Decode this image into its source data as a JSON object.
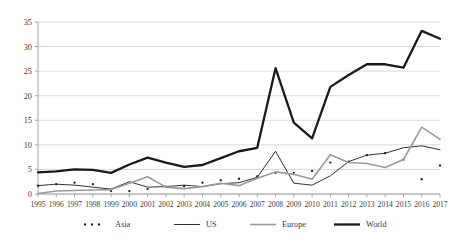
{
  "chart_data": {
    "type": "line",
    "title": "",
    "subtitle": "",
    "xlabel": "",
    "ylabel": "",
    "grid": "horizontal",
    "legend_position": "bottom",
    "ylim": [
      0,
      35
    ],
    "yticks": [
      0,
      5,
      10,
      15,
      20,
      25,
      30,
      35
    ],
    "ytick_labels": [
      "0",
      "5",
      "10",
      "15",
      "20",
      "25",
      "30",
      "35"
    ],
    "categories": [
      "1995",
      "1996",
      "1997",
      "1998",
      "1999",
      "2000",
      "2001",
      "2002",
      "2003",
      "2004",
      "2005",
      "2006",
      "2007",
      "2008",
      "2009",
      "2010",
      "2011",
      "2012",
      "2013",
      "2014",
      "2015",
      "2016",
      "2017"
    ],
    "series": [
      {
        "name": "Asia",
        "style": "dotted",
        "color": "#1a1a1a",
        "values": [
          1.7,
          2.0,
          2.3,
          2.0,
          0.6,
          0.6,
          1.0,
          1.5,
          1.6,
          2.3,
          2.8,
          3.1,
          3.6,
          4.3,
          4.3,
          4.7,
          6.4,
          6.6,
          7.9,
          8.3,
          7.0,
          3.0,
          5.8
        ]
      },
      {
        "name": "US",
        "style": "thin-solid",
        "color": "#1a1a1a",
        "values": [
          1.7,
          2.0,
          1.8,
          1.4,
          1.0,
          2.5,
          1.4,
          1.5,
          1.8,
          1.5,
          2.1,
          2.3,
          3.4,
          8.7,
          2.2,
          1.8,
          3.7,
          6.6,
          7.9,
          8.3,
          9.4,
          9.8,
          9.0
        ]
      },
      {
        "name": "Europe",
        "style": "gray-solid",
        "color": "#9a9a9a",
        "values": [
          0.1,
          0.6,
          0.7,
          0.8,
          0.9,
          2.2,
          3.5,
          1.4,
          1.1,
          1.5,
          2.2,
          1.7,
          3.2,
          4.5,
          4.0,
          3.0,
          8.0,
          6.4,
          6.2,
          5.4,
          7.0,
          13.6,
          11.1
        ]
      },
      {
        "name": "World",
        "style": "thick-solid",
        "color": "#1a1a1a",
        "values": [
          4.4,
          4.6,
          5.0,
          4.9,
          4.3,
          6.0,
          7.4,
          6.4,
          5.5,
          5.9,
          7.3,
          8.7,
          9.4,
          25.6,
          14.5,
          11.3,
          21.8,
          24.2,
          26.4,
          26.4,
          25.7,
          33.2,
          31.6
        ]
      }
    ]
  },
  "legend": {
    "items": [
      {
        "label": "Asia"
      },
      {
        "label": "US"
      },
      {
        "label": "Europe"
      },
      {
        "label": "World"
      }
    ]
  }
}
